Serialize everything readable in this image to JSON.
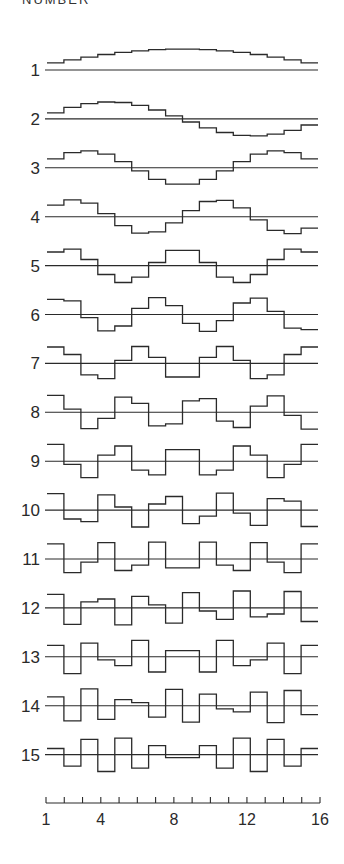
{
  "header": {
    "title": "NUMBER"
  },
  "colors": {
    "line": "#2a2a2a",
    "background": "#ffffff"
  },
  "axis": {
    "min": 1,
    "max": 16,
    "tick_labels": [
      "1",
      "4",
      "8",
      "12",
      "16"
    ],
    "tick_label_positions": [
      1,
      4,
      8,
      12,
      16
    ]
  },
  "chart_data": {
    "type": "line",
    "title": "NUMBER",
    "xlabel": "",
    "ylabel": "NUMBER",
    "x": [
      1,
      2,
      3,
      4,
      5,
      6,
      7,
      8,
      9,
      10,
      11,
      12,
      13,
      14,
      15,
      16
    ],
    "xlim": [
      1,
      16
    ],
    "style": "step waveforms (sampled sine basis functions), one per row with its own baseline",
    "series": [
      {
        "name": "1"
      },
      {
        "name": "2"
      },
      {
        "name": "3"
      },
      {
        "name": "4"
      },
      {
        "name": "5"
      },
      {
        "name": "6"
      },
      {
        "name": "7"
      },
      {
        "name": "8"
      },
      {
        "name": "9"
      },
      {
        "name": "10"
      },
      {
        "name": "11"
      },
      {
        "name": "12"
      },
      {
        "name": "13"
      },
      {
        "name": "14"
      },
      {
        "name": "15"
      }
    ],
    "formula": "value_k(n) = sin(pi * k * n / 17), n = 1..16, k = row number"
  }
}
